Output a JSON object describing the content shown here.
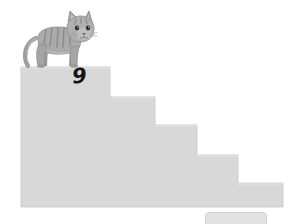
{
  "worksheet": {
    "title": "Cat on staircase counting worksheet",
    "background_color": "#ffffff"
  },
  "staircase": {
    "name": "descending-staircase",
    "fill_color": "#d8d8d8",
    "edge_color": "#cfcfcf",
    "step_count": 5,
    "baseline_y": 207,
    "left_x": 21,
    "right_x": 283,
    "steps": [
      {
        "index": 1,
        "label": "top-step",
        "x0": 21,
        "x1": 110,
        "top_y": 67
      },
      {
        "index": 2,
        "label": "second-step",
        "x0": 110,
        "x1": 155,
        "top_y": 97
      },
      {
        "index": 3,
        "label": "third-step",
        "x0": 155,
        "x1": 197,
        "top_y": 125
      },
      {
        "index": 4,
        "label": "fourth-step",
        "x0": 197,
        "x1": 238,
        "top_y": 155
      },
      {
        "index": 5,
        "label": "fifth-step",
        "x0": 238,
        "x1": 283,
        "top_y": 183
      }
    ],
    "step_number": "9"
  },
  "cat": {
    "name": "cat-illustration",
    "description": "gray striped tabby cat standing on the top step facing right",
    "body_color": "#a8a8a8",
    "shade_color": "#8f8f8f",
    "light_color": "#c2c2c2",
    "stripe_color": "#8a8a8a",
    "outline_color": "#6e6e6e",
    "eye_color": "#2b2b2b",
    "nose_color": "#6b6b6b",
    "position": {
      "x": 24,
      "y": 9,
      "width": 72,
      "height": 60
    },
    "facing": "right"
  },
  "bottom_tab": {
    "name": "bottom-tab",
    "fill_color": "#e2e2e2",
    "border_color": "#d2d2d2"
  },
  "icons": {
    "cat": "cat-icon",
    "staircase": "staircase-icon"
  }
}
